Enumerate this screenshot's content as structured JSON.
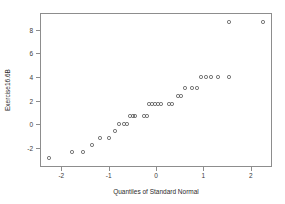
{
  "chart_data": {
    "type": "scatter",
    "title": "",
    "xlabel": "Quantiles of Standard Normal",
    "ylabel": "Exercise16.6B",
    "xlim": [
      -2.45,
      2.45
    ],
    "ylim": [
      -3.6,
      9.4
    ],
    "grid": false,
    "legend": null,
    "marker": "open-circle",
    "xticks": [
      -2,
      -1,
      0,
      1,
      2
    ],
    "xticklabels": [
      "-2",
      "-1",
      "0",
      "1",
      "2"
    ],
    "yticks": [
      -2,
      0,
      2,
      4,
      6,
      8
    ],
    "yticklabels": [
      "-2",
      "0",
      "2",
      "4",
      "6",
      "8"
    ],
    "n_points": 35,
    "x": [
      -2.25,
      -1.72,
      -1.48,
      -1.28,
      -1.1,
      -0.9,
      -0.75,
      -0.68,
      -0.57,
      -0.5,
      -0.44,
      -0.38,
      -0.32,
      -0.13,
      -0.06,
      0.0,
      0.06,
      0.13,
      0.19,
      0.26,
      0.44,
      0.5,
      0.63,
      0.7,
      0.78,
      0.92,
      1.02,
      1.12,
      1.22,
      1.33,
      1.48,
      1.72,
      2.18
    ],
    "y": [
      -3.0,
      -2.2,
      -2.2,
      -1.4,
      -0.6,
      -0.6,
      0.3,
      1.1,
      1.1,
      1.1,
      2.0,
      2.0,
      2.0,
      2.0,
      2.0,
      3.0,
      3.0,
      3.0,
      3.0,
      3.0,
      3.0,
      3.0,
      3.9,
      3.9,
      4.8,
      4.8,
      4.8,
      5.8,
      5.8,
      5.8,
      5.8,
      5.8,
      5.8
    ],
    "points_px": [
      [
        48,
        157
      ],
      [
        71,
        151
      ],
      [
        82,
        151
      ],
      [
        91,
        144
      ],
      [
        99,
        137
      ],
      [
        108,
        137
      ],
      [
        114,
        130
      ],
      [
        118,
        123
      ],
      [
        123,
        123
      ],
      [
        126,
        123
      ],
      [
        129,
        115
      ],
      [
        132,
        115
      ],
      [
        134,
        115
      ],
      [
        143,
        115
      ],
      [
        146,
        115
      ],
      [
        148,
        103
      ],
      [
        151,
        103
      ],
      [
        154,
        103
      ],
      [
        157,
        103
      ],
      [
        160,
        103
      ],
      [
        168,
        103
      ],
      [
        171,
        103
      ],
      [
        177,
        95
      ],
      [
        180,
        95
      ],
      [
        184,
        87
      ],
      [
        191,
        87
      ],
      [
        196,
        87
      ],
      [
        200,
        76
      ],
      [
        205,
        76
      ],
      [
        210,
        76
      ],
      [
        217,
        76
      ],
      [
        228,
        76
      ],
      [
        228,
        21
      ],
      [
        262,
        21
      ]
    ]
  },
  "axis": {
    "x_title": "Quantiles of Standard Normal",
    "y_title": "Exercise16.6B"
  }
}
